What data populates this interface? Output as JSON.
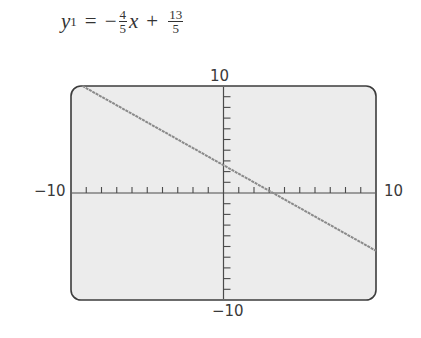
{
  "equation": {
    "lhs_var": "y",
    "lhs_sub": "1",
    "equals": "=",
    "sign1": "−",
    "frac1_num": "4",
    "frac1_den": "5",
    "var": "x",
    "sign2": "+",
    "frac2_num": "13",
    "frac2_den": "5"
  },
  "axes": {
    "ymax_label": "10",
    "ymin_label": "−10",
    "xmin_label": "−10",
    "xmax_label": "10"
  },
  "colors": {
    "screen_bg": "#ececec",
    "frame": "#3c3c3c",
    "line": "#8a8a8a",
    "axis": "#4a4a4a"
  },
  "chart_data": {
    "type": "line",
    "function": "y = -0.8x + 2.6",
    "series": [
      {
        "name": "y1",
        "x": [
          -9.25,
          -5,
          0,
          3.25,
          5,
          10
        ],
        "y": [
          10,
          6.6,
          2.6,
          0,
          -1.4,
          -5.4
        ]
      }
    ],
    "xlim": [
      -10,
      10
    ],
    "ylim": [
      -10,
      10
    ],
    "xscale": 1,
    "yscale": 1,
    "x_ticks": 20,
    "y_ticks": 20,
    "xlabel": "",
    "ylabel": "",
    "grid": false,
    "legend": "none"
  }
}
